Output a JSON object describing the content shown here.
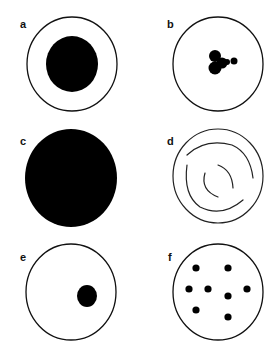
{
  "figure": {
    "panels": [
      {
        "label": "a",
        "description": "circle with large solid central disc"
      },
      {
        "label": "b",
        "description": "circle with small clustered blob near center"
      },
      {
        "label": "c",
        "description": "fully filled solid disc"
      },
      {
        "label": "d",
        "description": "circle with concentric broken curved lines"
      },
      {
        "label": "e",
        "description": "circle with small off-center solid dot"
      },
      {
        "label": "f",
        "description": "circle with scattered small dots"
      }
    ]
  }
}
